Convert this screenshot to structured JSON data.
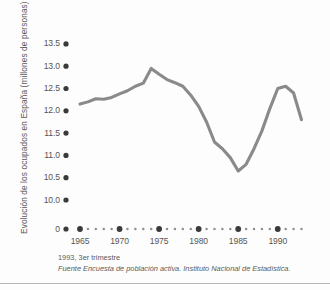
{
  "chart_data": {
    "type": "line",
    "title": "",
    "xlabel": "",
    "ylabel": "Evolución de los ocupados en España (millones de personas)",
    "xlim": [
      1965,
      1993
    ],
    "ylim": [
      9.85,
      13.62
    ],
    "y_axis_break": true,
    "y_break_label": "0",
    "grid": false,
    "legend": null,
    "line_color": "#8a8a8a",
    "line_width": 3.1,
    "tick_dot_color": "#3a3a3a",
    "x_major_ticks": [
      1965,
      1970,
      1975,
      1980,
      1985,
      1990
    ],
    "x_minor_ticks": [
      1966,
      1967,
      1968,
      1969,
      1971,
      1972,
      1973,
      1974,
      1976,
      1977,
      1978,
      1979,
      1981,
      1982,
      1983,
      1984,
      1986,
      1987,
      1988,
      1989,
      1991,
      1992,
      1993
    ],
    "y_ticks": [
      "0",
      "10.0",
      "10.5",
      "11.0",
      "11.5",
      "12.0",
      "12.5",
      "13.0",
      "13.5"
    ],
    "y_tick_values": [
      10.0,
      10.5,
      11.0,
      11.5,
      12.0,
      12.5,
      13.0,
      13.5
    ],
    "x": [
      1965,
      1966,
      1967,
      1968,
      1969,
      1970,
      1971,
      1972,
      1973,
      1974,
      1975,
      1976,
      1977,
      1978,
      1979,
      1980,
      1981,
      1982,
      1983,
      1984,
      1985,
      1986,
      1987,
      1988,
      1989,
      1990,
      1991,
      1992,
      1993
    ],
    "values": [
      12.15,
      12.2,
      12.27,
      12.26,
      12.3,
      12.38,
      12.45,
      12.55,
      12.62,
      12.95,
      12.82,
      12.7,
      12.63,
      12.55,
      12.35,
      12.1,
      11.75,
      11.3,
      11.15,
      10.95,
      10.65,
      10.8,
      11.15,
      11.55,
      12.05,
      12.5,
      12.55,
      12.4,
      11.8
    ],
    "series_name": "Ocupados en España"
  },
  "footnotes": {
    "period": "1993, 3er trimestre",
    "source": "Fuente  Encuesta de población activa. Instituto Nacional de Estadística."
  },
  "xtick_labels": [
    "1965",
    "1970",
    "1975",
    "1980",
    "1985",
    "1990"
  ]
}
